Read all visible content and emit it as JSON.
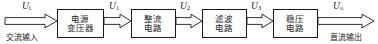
{
  "diagram": {
    "type": "block-diagram",
    "orientation": "left-to-right",
    "background_color": "#ffffff",
    "line_color": "#1a1a1a",
    "blocks": [
      {
        "id": "transformer",
        "line1": "电源",
        "line2": "变压器",
        "x": 57,
        "y": 9,
        "w": 47,
        "h": 29
      },
      {
        "id": "rectifier",
        "line1": "整流",
        "line2": "电路",
        "x": 131,
        "y": 9,
        "w": 45,
        "h": 29
      },
      {
        "id": "filter",
        "line1": "滤波",
        "line2": "电路",
        "x": 202,
        "y": 9,
        "w": 45,
        "h": 29
      },
      {
        "id": "regulator",
        "line1": "稳压",
        "line2": "电路",
        "x": 273,
        "y": 9,
        "w": 45,
        "h": 29
      }
    ],
    "signals": [
      {
        "id": "u-in",
        "symbol": "U",
        "subscript": "i",
        "x": 22,
        "y": 2
      },
      {
        "id": "u-1",
        "symbol": "U",
        "subscript": "1",
        "x": 109,
        "y": 2
      },
      {
        "id": "u-2",
        "symbol": "U",
        "subscript": "2",
        "x": 180,
        "y": 2
      },
      {
        "id": "u-3",
        "symbol": "U",
        "subscript": "3",
        "x": 251,
        "y": 2
      },
      {
        "id": "u-out",
        "symbol": "U",
        "subscript": "o",
        "x": 333,
        "y": 2
      }
    ],
    "captions": [
      {
        "id": "ac-input",
        "text": "交流输入",
        "x": 6,
        "y": 31
      },
      {
        "id": "dc-output",
        "text": "直流输出",
        "x": 330,
        "y": 31
      }
    ],
    "arrows": [
      {
        "id": "arrow-in",
        "x1": 5,
        "x2": 57,
        "y": 21
      },
      {
        "id": "arrow-transformer-rectifier",
        "x1": 104,
        "x2": 131,
        "y": 21
      },
      {
        "id": "arrow-rectifier-filter",
        "x1": 176,
        "x2": 202,
        "y": 21
      },
      {
        "id": "arrow-filter-regulator",
        "x1": 247,
        "x2": 273,
        "y": 21
      },
      {
        "id": "arrow-out",
        "x1": 318,
        "x2": 374,
        "y": 21
      }
    ]
  }
}
